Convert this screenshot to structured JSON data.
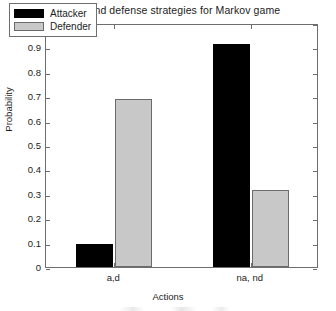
{
  "chart_data": {
    "type": "bar",
    "title": "Attack and defense strategies for Markov game",
    "xlabel": "Actions",
    "ylabel": "Probability",
    "categories": [
      "a,d",
      "na, nd"
    ],
    "series": [
      {
        "name": "Attacker",
        "color": "#000000",
        "values": [
          0.095,
          0.915
        ]
      },
      {
        "name": "Defender",
        "color": "#c8c8c8",
        "values": [
          0.69,
          0.315
        ]
      }
    ],
    "ylim": [
      0,
      1
    ],
    "yticks": [
      0,
      0.1,
      0.2,
      0.3,
      0.4,
      0.5,
      0.6,
      0.7,
      0.8,
      0.9,
      1
    ],
    "ytick_labels": [
      "0",
      "0.1",
      "0.2",
      "0.3",
      "0.4",
      "0.5",
      "0.6",
      "0.7",
      "0.8",
      "0.9",
      "1"
    ],
    "grid": false,
    "legend_position": "top-left",
    "frame": "box",
    "tick_direction": "in"
  }
}
